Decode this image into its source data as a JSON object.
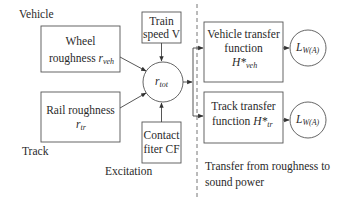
{
  "diagram": {
    "labels": {
      "vehicle": "Vehicle",
      "track": "Track",
      "excitation": "Excitation",
      "transfer_line1": "Transfer from roughness to",
      "transfer_line2": "sound power"
    },
    "nodes": {
      "wheel_roughness": {
        "line1": "Wheel",
        "line2": "roughness ",
        "symbol": "r",
        "subscript": "veh"
      },
      "rail_roughness": {
        "line1": "Rail roughness",
        "symbol": "r",
        "subscript": "tr"
      },
      "train_speed": {
        "line1": "Train",
        "line2": "speed V"
      },
      "contact_filter": {
        "line1": "Contact",
        "line2": "fiter CF"
      },
      "total_roughness": {
        "symbol": "r",
        "subscript": "tot"
      },
      "vehicle_transfer": {
        "line1": "Vehicle transfer",
        "line2": "function",
        "symbol": "H*",
        "subscript": "veh"
      },
      "track_transfer": {
        "line1": "Track transfer",
        "line2": "function ",
        "symbol": "H*",
        "subscript": "tr"
      },
      "output_vehicle": {
        "symbol": "L",
        "subscript": "W(A)"
      },
      "output_track": {
        "symbol": "L",
        "subscript": "W(A)"
      }
    },
    "edges": [
      {
        "from": "wheel_roughness",
        "to": "total_roughness"
      },
      {
        "from": "rail_roughness",
        "to": "total_roughness"
      },
      {
        "from": "train_speed",
        "to": "total_roughness"
      },
      {
        "from": "contact_filter",
        "to": "total_roughness"
      },
      {
        "from": "total_roughness",
        "to": "vehicle_transfer"
      },
      {
        "from": "total_roughness",
        "to": "track_transfer"
      },
      {
        "from": "vehicle_transfer",
        "to": "output_vehicle"
      },
      {
        "from": "track_transfer",
        "to": "output_track"
      }
    ],
    "colors": {
      "stroke": "#555555",
      "text": "#2a2a2a",
      "background": "#ffffff"
    }
  }
}
